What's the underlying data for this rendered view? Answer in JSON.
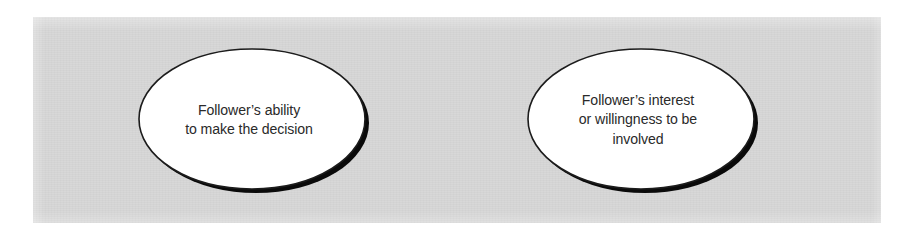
{
  "figure": {
    "background_color": "#ffffff",
    "panel_color": "#d8d8d8",
    "text_color": "#2a2a2a",
    "shape_fill": "#ffffff",
    "shape_outline": "#1a1a1a",
    "shadow_color": "#000000"
  },
  "nodes": [
    {
      "id": "follower-ability",
      "shape": "ellipse",
      "lines": [
        "Follower’s ability",
        "to make the decision"
      ],
      "text": "Follower’s ability to make the decision"
    },
    {
      "id": "follower-interest",
      "shape": "ellipse",
      "lines": [
        "Follower’s interest",
        "or willingness to be",
        "involved"
      ],
      "text": "Follower’s interest or willingness to be involved"
    }
  ]
}
